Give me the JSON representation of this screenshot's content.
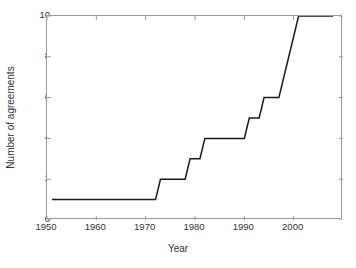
{
  "chart_data": {
    "type": "line",
    "title": "",
    "subtitle": "",
    "xlabel": "Year",
    "ylabel": "Number of agreements",
    "xlim": [
      1950,
      2010
    ],
    "ylim": [
      0,
      10
    ],
    "xticks": [
      1950,
      1960,
      1970,
      1980,
      1990,
      2000
    ],
    "yticks": [
      0,
      2,
      4,
      6,
      8,
      10
    ],
    "xtick_labels": [
      "1950",
      "1960",
      "1970",
      "1980",
      "1990",
      "2000"
    ],
    "ytick_labels": [
      "0",
      "2",
      "4",
      "6",
      "8",
      "10"
    ],
    "grid": false,
    "legend": null,
    "legend_position": "none",
    "series": [
      {
        "name": "Cumulative agreements",
        "style": "step-like cumulative line",
        "color": "#1a1a1a",
        "line_width": 1.5,
        "x": [
          1951,
          1972,
          1973,
          1978,
          1979,
          1981,
          1982,
          1990,
          1991,
          1993,
          1994,
          1997,
          1998,
          2001,
          2008
        ],
        "y": [
          1,
          1,
          2,
          2,
          3,
          3,
          4,
          4,
          5,
          5,
          6,
          6,
          7,
          10,
          10
        ]
      }
    ],
    "annotations": []
  },
  "axes": {
    "box_color": "#9a9a9a",
    "tick_color": "#9a9a9a",
    "background": "#ffffff",
    "tick_direction": "in"
  }
}
